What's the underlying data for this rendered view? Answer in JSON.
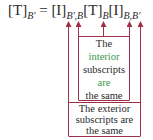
{
  "equation": {
    "lhs_matrix": "[T]",
    "lhs_subscript": "B'",
    "equals": "=",
    "term1_matrix": "[I]",
    "term1_subscript": "B',B",
    "term2_matrix": "[T]",
    "term2_subscript": "B",
    "term3_matrix": "[I]",
    "term3_subscript": "B,B'"
  },
  "annotations": {
    "inner": {
      "line1": "The",
      "highlight": "interior",
      "line3": "subscripts",
      "line4": "are",
      "line5": "the same"
    },
    "outer": {
      "line1": "The exterior",
      "line2": "subscripts are",
      "line3": "the same"
    }
  },
  "colors": {
    "arrow": "#a0304a",
    "text": "#2a2a2a",
    "highlight": "#3a9a4a"
  }
}
